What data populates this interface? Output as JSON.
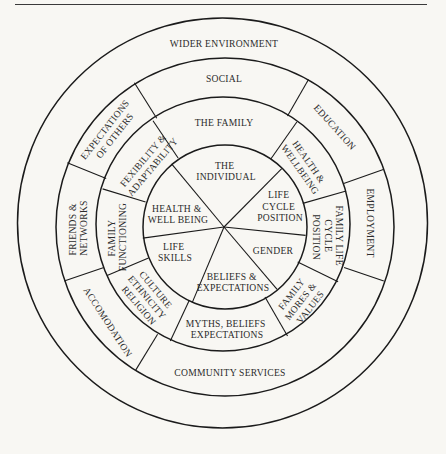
{
  "colors": {
    "background": "#f8f7f3",
    "line": "#1b1b1b",
    "text": "#2c2c2c"
  },
  "diagram": {
    "outer_ring": {
      "label": [
        "WIDER ENVIRONMENT"
      ]
    },
    "social_ring": {
      "social": [
        "SOCIAL"
      ],
      "education": [
        "EDUCATION"
      ],
      "employment": [
        "EMPLOYMENT"
      ],
      "community_services": [
        "COMMUNITY SERVICES"
      ],
      "accomodation": [
        "ACCOMODATION"
      ],
      "friends_networks": [
        "FRIENDS &",
        "NETWORKS"
      ],
      "expectations_of_others": [
        "EXPECTATIONS",
        "OF OTHERS"
      ]
    },
    "family_ring": {
      "the_family": [
        "THE FAMILY"
      ],
      "health_wellbeing": [
        "HEALTH &",
        "WELLBEING"
      ],
      "family_life_cycle_position": [
        "FAMILY LIFE",
        "CYCLE",
        "POSITION"
      ],
      "family_mores_values": [
        "FAMILY",
        "MORES &",
        "VALUES"
      ],
      "myths_beliefs_expectations": [
        "MYTHS, BELIEFS",
        "EXPECTATIONS"
      ],
      "culture_ethnicity_religion": [
        "CULTURE",
        "ETHNICITY",
        "RELIGION"
      ],
      "family_functioning": [
        "FAMILY",
        "FUNCTIONING"
      ],
      "flexibility_adaptability": [
        "FEXIBILITY &",
        "ADAPTABILITY"
      ]
    },
    "individual_core": {
      "the_individual": [
        "THE",
        "INDIVIDUAL"
      ],
      "life_cycle_position": [
        "LIFE",
        "CYCLE",
        "POSITION"
      ],
      "gender": [
        "GENDER"
      ],
      "beliefs_expectations": [
        "BELIEFS &",
        "EXPECTATIONS"
      ],
      "life_skills": [
        "LIFE",
        "SKILLS"
      ],
      "health_well_being": [
        "HEALTH &",
        "WELL BEING"
      ]
    }
  }
}
